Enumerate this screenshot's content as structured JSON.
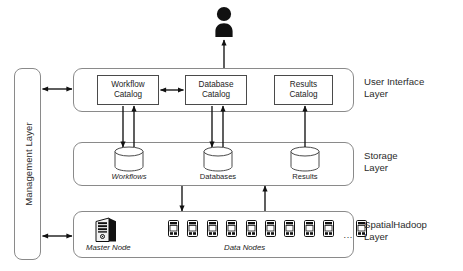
{
  "diagram": {
    "background": "#ffffff",
    "line_color": "#4a4a4a",
    "layer_border_color": "#8a8a8a",
    "icon_color": "#111111"
  },
  "management": {
    "label": "Management Layer"
  },
  "layers": [
    {
      "id": "user-interface",
      "caption": "User Interface\nLayer"
    },
    {
      "id": "storage",
      "caption": "Storage\nLayer"
    },
    {
      "id": "spatialhadoop",
      "caption": "SpatialHadoop\nLayer"
    }
  ],
  "catalogs": [
    {
      "id": "workflow-catalog",
      "line1": "Workflow",
      "line2": "Catalog"
    },
    {
      "id": "database-catalog",
      "line1": "Database",
      "line2": "Catalog"
    },
    {
      "id": "results-catalog",
      "line1": "Results",
      "line2": "Catalog"
    }
  ],
  "stores": [
    {
      "id": "workflows-store",
      "label": "Workflows",
      "italic": true
    },
    {
      "id": "databases-store",
      "label": "Databases",
      "italic": false
    },
    {
      "id": "results-store",
      "label": "Results",
      "italic": false
    }
  ],
  "hadoop": {
    "master_label": "Master Node",
    "data_nodes_label": "Data Nodes",
    "data_node_count": 9,
    "trailing_node_count": 1,
    "ellipsis": "..."
  },
  "actor": {
    "name": "user-actor"
  }
}
